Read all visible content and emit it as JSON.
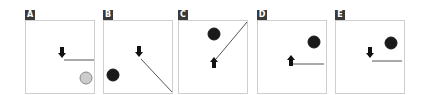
{
  "figure": {
    "panels": [
      {
        "label": "A",
        "left": 25,
        "arrow": {
          "x": 37,
          "y": 33,
          "direction": "down"
        },
        "line": {
          "x1": 39,
          "y1": 40,
          "x2": 69,
          "y2": 40
        },
        "ball": {
          "cx": 61,
          "cy": 58,
          "r": 6,
          "fill": "#cccccc",
          "stroke": "#888888"
        }
      },
      {
        "label": "B",
        "left": 103,
        "arrow": {
          "x": 36,
          "y": 32,
          "direction": "down"
        },
        "line": {
          "x1": 38,
          "y1": 39,
          "x2": 69,
          "y2": 72
        },
        "ball": {
          "cx": 10,
          "cy": 55,
          "r": 6,
          "fill": "#1a1a1a",
          "stroke": "#1a1a1a"
        }
      },
      {
        "label": "C",
        "left": 178,
        "arrow": {
          "x": 36,
          "y": 42,
          "direction": "up"
        },
        "line": {
          "x1": 38,
          "y1": 39,
          "x2": 69,
          "y2": 2
        },
        "ball": {
          "cx": 36,
          "cy": 14,
          "r": 6,
          "fill": "#1a1a1a",
          "stroke": "#1a1a1a"
        }
      },
      {
        "label": "D",
        "left": 257,
        "arrow": {
          "x": 34,
          "y": 40,
          "direction": "up"
        },
        "line": {
          "x1": 36,
          "y1": 44,
          "x2": 67,
          "y2": 44
        },
        "ball": {
          "cx": 57,
          "cy": 22,
          "r": 6,
          "fill": "#1a1a1a",
          "stroke": "#1a1a1a"
        }
      },
      {
        "label": "E",
        "left": 335,
        "arrow": {
          "x": 35,
          "y": 33,
          "direction": "down"
        },
        "line": {
          "x1": 37,
          "y1": 41,
          "x2": 67,
          "y2": 41
        },
        "ball": {
          "cx": 56,
          "cy": 23,
          "r": 6,
          "fill": "#1a1a1a",
          "stroke": "#1a1a1a"
        }
      }
    ],
    "colors": {
      "frame": "#cfcfcf",
      "label_bg": "#3a3a3a",
      "label_text": "#ffffff",
      "arrow": "#111111",
      "line": "#555555"
    }
  }
}
